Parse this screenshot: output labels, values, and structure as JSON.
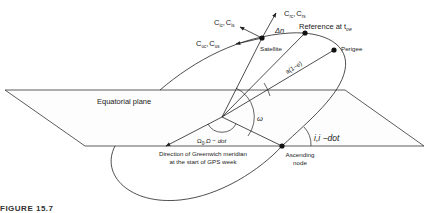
{
  "figure": {
    "caption": "FIGURE 15.7",
    "labels": {
      "equatorial_plane": "Equatorial plane",
      "satellite": "Satellite",
      "reference": "Reference at t",
      "reference_sub": "oe",
      "perigee": "Perigee",
      "semi_axis": "a(1−e)",
      "delta_n": "Δn",
      "omega_small": "ω",
      "inclination": "i,i −dot",
      "raan": "Ω",
      "raan_sub": "0",
      "raan_rest": ",Ω − dot",
      "greenwich_line1": "Direction of Greenwich meridian",
      "greenwich_line2": "at the start of GPS week",
      "ascending_line1": "Ascending",
      "ascending_line2": "node",
      "c_rc": "C",
      "c_rc_sub": "rc",
      "c_rs": "C",
      "c_rs_sub": "rs",
      "c_ic": "C",
      "c_ic_sub": "ic",
      "c_is": "C",
      "c_is_sub": "is",
      "c_uc": "C",
      "c_uc_sub": "uc",
      "c_us": "C",
      "c_us_sub": "us",
      "comma": ","
    },
    "colors": {
      "stroke": "#222222",
      "plane_fill": "#fdfdfd"
    }
  }
}
